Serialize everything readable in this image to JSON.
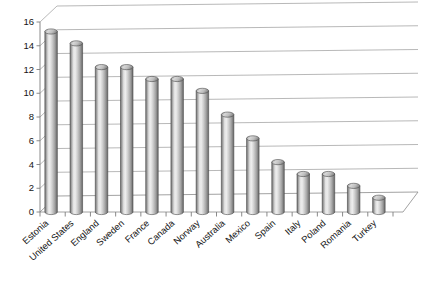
{
  "chart_data": {
    "type": "bar",
    "title": "",
    "subtitle": "",
    "xlabel": "",
    "ylabel": "",
    "categories": [
      "Estonia",
      "United States",
      "England",
      "Sweden",
      "France",
      "Canada",
      "Norway",
      "Australia",
      "Mexico",
      "Spain",
      "Italy",
      "Poland",
      "Romania",
      "Turkey"
    ],
    "values": [
      15.2,
      14.2,
      12.2,
      12.2,
      11.2,
      11.2,
      10.2,
      8.2,
      6.2,
      4.2,
      3.2,
      3.2,
      2.2,
      1.2
    ],
    "series": [
      {
        "name": "",
        "values": [
          15.2,
          14.2,
          12.2,
          12.2,
          11.2,
          11.2,
          10.2,
          8.2,
          6.2,
          4.2,
          3.2,
          3.2,
          2.2,
          1.2
        ]
      }
    ],
    "ylim": [
      0,
      16
    ],
    "ytick_labels": [
      "0",
      "2",
      "4",
      "6",
      "8",
      "10",
      "12",
      "14",
      "16"
    ],
    "ytick_values": [
      0,
      2,
      4,
      6,
      8,
      10,
      12,
      14,
      16
    ],
    "grid": true,
    "grid_axis": "y",
    "legend": false,
    "legend_position": "none",
    "style": "3d-cylinder",
    "annotations": [],
    "colors": {
      "bar_light": "#e9e9e9",
      "bar_mid": "#b9b9b9",
      "bar_dark": "#6e6e6e",
      "bar_outline": "#4a4a4a",
      "gridline": "#9a9a9a",
      "axis": "#7d7d7d",
      "text": "#141414",
      "background": "#ffffff"
    }
  }
}
